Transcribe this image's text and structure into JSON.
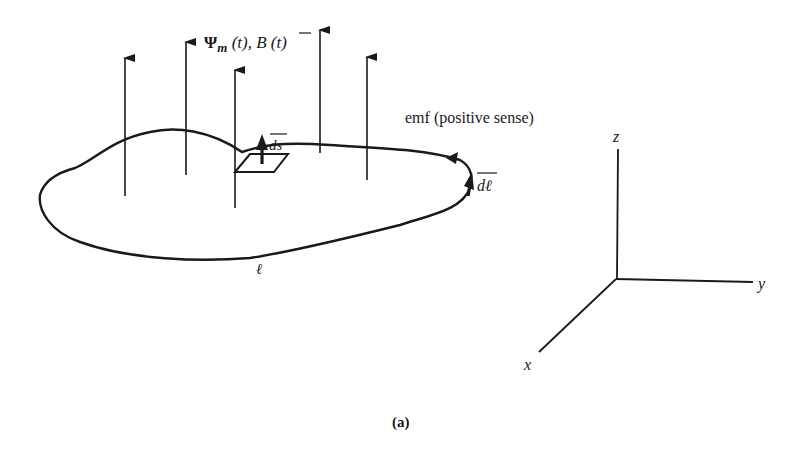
{
  "figure": {
    "caption": "(a)",
    "flux_label": {
      "psi": "Ψ",
      "psi_sub": "m",
      "psi_arg": " (t), ",
      "b": "B",
      "b_arg": " (t)"
    },
    "emf_label": "emf (positive sense)",
    "dl_label": "dℓ",
    "ds_label": "ds",
    "loop_label": "ℓ",
    "axes": {
      "x": "x",
      "y": "y",
      "z": "z"
    },
    "colors": {
      "ink": "#1a1a1a",
      "background": "#ffffff"
    }
  }
}
